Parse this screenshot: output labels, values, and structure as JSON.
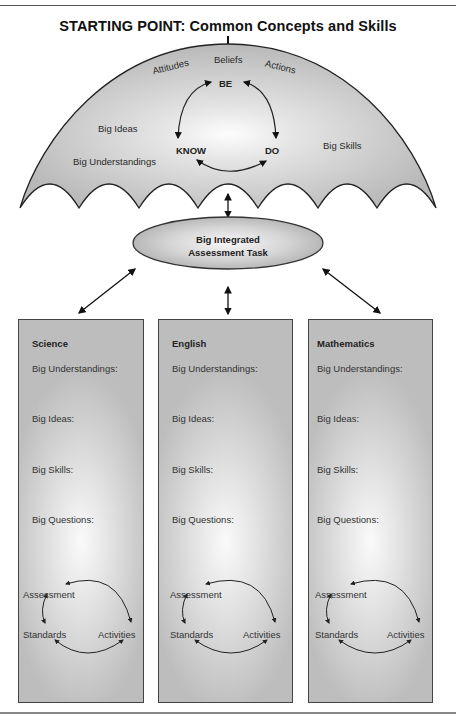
{
  "title": "STARTING POINT: Common Concepts and Skills",
  "umbrella": {
    "arc_labels": [
      "Attitudes",
      "Beliefs",
      "Actions"
    ],
    "cycle": {
      "top": "BE",
      "left": "KNOW",
      "right": "DO"
    },
    "left_labels": [
      "Big Ideas",
      "Big Understandings"
    ],
    "right_labels": [
      "Big Skills"
    ],
    "fill_color": "#c8c8c8"
  },
  "center_task": {
    "line1": "Big Integrated",
    "line2": "Assessment Task"
  },
  "subjects": [
    {
      "name": "Science",
      "fields": [
        "Big Understandings:",
        "Big Ideas:",
        "Big Skills:",
        "Big Questions:"
      ],
      "cycle": {
        "top": "Assessment",
        "left": "Standards",
        "right": "Activities"
      }
    },
    {
      "name": "English",
      "fields": [
        "Big Understandings:",
        "Big Ideas:",
        "Big Skills:",
        "Big Questions:"
      ],
      "cycle": {
        "top": "Assessment",
        "left": "Standards",
        "right": "Activities"
      }
    },
    {
      "name": "Mathematics",
      "fields": [
        "Big Understandings:",
        "Big Ideas:",
        "Big Skills:",
        "Big Questions:"
      ],
      "cycle": {
        "top": "Assessment",
        "left": "Standards",
        "right": "Activities"
      }
    }
  ]
}
